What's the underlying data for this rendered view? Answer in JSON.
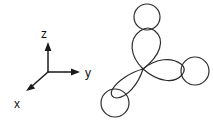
{
  "figure": {
    "background_color": "#ffffff",
    "stroke_color": "#2b2b2b",
    "label_color": "#111111",
    "width": 213,
    "height": 120
  },
  "axes": {
    "name": "coordinate-axes",
    "origin": {
      "x": 48,
      "y": 72
    },
    "items": [
      {
        "id": "z",
        "label": "z",
        "direction": "up",
        "tip": {
          "x": 48,
          "y": 44
        },
        "label_pos": {
          "x": 44,
          "y": 38
        }
      },
      {
        "id": "y",
        "label": "y",
        "direction": "right",
        "tip": {
          "x": 79,
          "y": 72
        },
        "label_pos": {
          "x": 85,
          "y": 77
        }
      },
      {
        "id": "x",
        "label": "x",
        "direction": "down-left",
        "tip": {
          "x": 28,
          "y": 90
        },
        "label_pos": {
          "x": 17,
          "y": 107
        }
      }
    ]
  },
  "orbital": {
    "name": "three-lobed-orbital",
    "center": {
      "x": 143,
      "y": 69
    },
    "lobe_count": 3,
    "lobes": [
      {
        "id": "lobe-top",
        "label": "top lobe",
        "direction": "up",
        "tip": {
          "x": 147,
          "y": 30
        },
        "circle": {
          "cx": 147,
          "cy": 17,
          "r": 13
        }
      },
      {
        "id": "lobe-right",
        "label": "right lobe",
        "direction": "right",
        "tip": {
          "x": 184,
          "y": 72
        },
        "circle": {
          "cx": 195,
          "cy": 71,
          "r": 14
        }
      },
      {
        "id": "lobe-lower-left",
        "label": "lower-left lobe",
        "direction": "down-left",
        "tip": {
          "x": 124,
          "y": 95
        },
        "circle": {
          "cx": 115,
          "cy": 103,
          "r": 14
        }
      }
    ]
  }
}
